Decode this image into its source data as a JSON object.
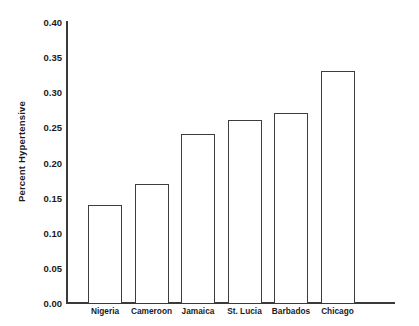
{
  "chart_data": {
    "type": "bar",
    "title": "",
    "subtitle": "",
    "xlabel": "",
    "ylabel": "Percent Hypertensive",
    "categories": [
      "Nigeria",
      "Cameroon",
      "Jamaica",
      "St. Lucia",
      "Barbados",
      "Chicago"
    ],
    "values": [
      0.14,
      0.17,
      0.24,
      0.26,
      0.27,
      0.33
    ],
    "ylim": [
      0.0,
      0.4
    ],
    "ytick_values": [
      0.0,
      0.05,
      0.1,
      0.15,
      0.2,
      0.25,
      0.3,
      0.35,
      0.4
    ],
    "ytick_labels": [
      "0.00",
      "0.05",
      "0.10",
      "0.15",
      "0.20",
      "0.25",
      "0.30",
      "0.35",
      "0.40"
    ],
    "grid": false,
    "legend": "none",
    "bar_fill_color": "#ffffff",
    "bar_edge_color": "#3d3d3d",
    "axis_color": "#3a3a3a",
    "background_color": "#ffffff"
  }
}
